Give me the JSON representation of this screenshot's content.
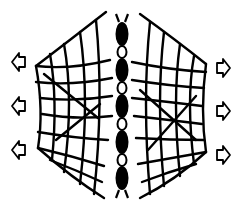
{
  "figure": {
    "colors": {
      "ink": "#000000",
      "background": "#ffffff"
    },
    "left_arrows": [
      {
        "y": 62,
        "direction": "left"
      },
      {
        "y": 106,
        "direction": "left"
      },
      {
        "y": 150,
        "direction": "left"
      }
    ],
    "right_arrows": [
      {
        "y": 68,
        "direction": "right"
      },
      {
        "y": 111,
        "direction": "right"
      },
      {
        "y": 155,
        "direction": "right"
      }
    ],
    "chain": {
      "solid_links": 5,
      "hollow_links": 4
    }
  }
}
